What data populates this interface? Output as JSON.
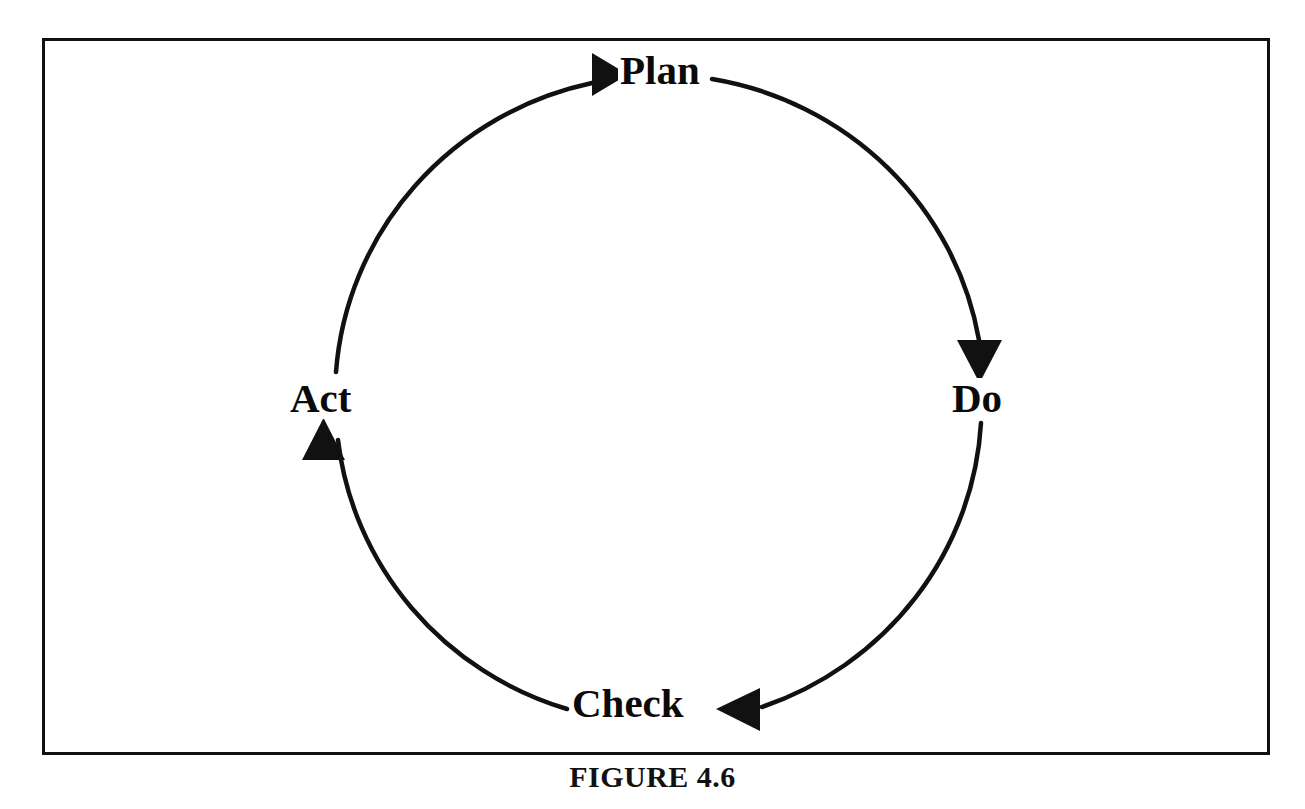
{
  "figure": {
    "caption": "FIGURE 4.6",
    "frame": {
      "border_color": "#111111",
      "border_width_px": 3,
      "x": 42,
      "y": 38,
      "width": 1228,
      "height": 717
    }
  },
  "diagram": {
    "type": "cycle",
    "name": "PDCA cycle",
    "direction": "clockwise",
    "stroke_color": "#111111",
    "stroke_width_px": 4,
    "center": {
      "x": 659,
      "y": 395
    },
    "radius": {
      "rx": 326,
      "ry": 320
    },
    "nodes": [
      {
        "id": "plan",
        "label": "Plan",
        "position": "top",
        "incoming_arrow": "arrowhead-right",
        "arrow_direction": "right"
      },
      {
        "id": "do",
        "label": "Do",
        "position": "right",
        "incoming_arrow": "arrowhead-down",
        "arrow_direction": "down"
      },
      {
        "id": "check",
        "label": "Check",
        "position": "bottom",
        "incoming_arrow": "arrowhead-left",
        "arrow_direction": "left"
      },
      {
        "id": "act",
        "label": "Act",
        "position": "left",
        "incoming_arrow": "arrowhead-up",
        "arrow_direction": "up"
      }
    ]
  },
  "colors": {
    "background": "#ffffff",
    "ink": "#111111",
    "text": "#0a0a0a"
  }
}
